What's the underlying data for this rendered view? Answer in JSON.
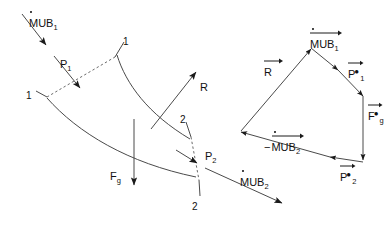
{
  "figure": {
    "type": "engineering-diagram",
    "background": "#ffffff",
    "line_color": "#4a4a4a",
    "text_color": "#111111"
  },
  "blade_diagram": {
    "name": "blade-passage",
    "labels": {
      "inlet_flow": "MUB",
      "inlet_flow_sub": "1",
      "inlet_pressure": "P",
      "inlet_pressure_sub": "1",
      "station_one_upper": "1",
      "station_one_lower": "1",
      "reaction": "R",
      "gravity": "F",
      "gravity_sub": "g",
      "station_two_upper": "2",
      "station_two_lower": "2",
      "outlet_pressure": "P",
      "outlet_pressure_sub": "2",
      "outlet_flow": "MUB",
      "outlet_flow_sub": "2"
    }
  },
  "force_polygon": {
    "name": "force-polygon",
    "vectors": [
      {
        "id": "mub1",
        "label": "MUB",
        "sub": "1",
        "sign": "",
        "star": false,
        "overbar": true,
        "overdot": true
      },
      {
        "id": "p1star",
        "label": "P",
        "sub": "1",
        "sign": "",
        "star": true,
        "overbar": true,
        "overdot": false
      },
      {
        "id": "fgstar",
        "label": "F",
        "sub": "g",
        "sign": "",
        "star": true,
        "overbar": true,
        "overdot": false
      },
      {
        "id": "p2star",
        "label": "P",
        "sub": "2",
        "sign": "",
        "star": true,
        "overbar": true,
        "overdot": false
      },
      {
        "id": "mub2neg",
        "label": "MUB",
        "sub": "2",
        "sign": "−",
        "star": false,
        "overbar": true,
        "overdot": true
      },
      {
        "id": "resultant",
        "label": "R",
        "sub": "",
        "sign": "",
        "star": false,
        "overbar": true,
        "overdot": false
      }
    ]
  }
}
